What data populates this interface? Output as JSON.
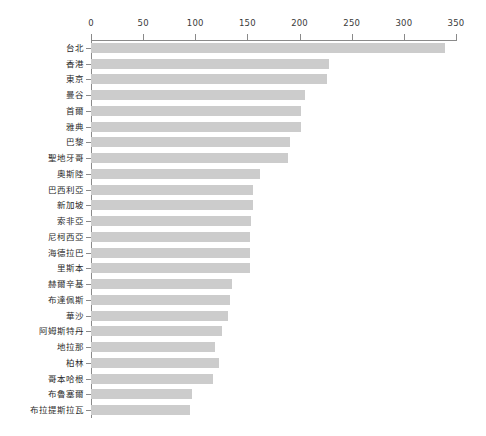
{
  "chart_data": {
    "type": "bar",
    "orientation": "horizontal",
    "title": "",
    "subtitle": "",
    "xlabel": "",
    "ylabel": "",
    "xlim": [
      0,
      350
    ],
    "xticks": [
      0,
      50,
      100,
      150,
      200,
      250,
      300,
      350
    ],
    "grid": false,
    "legend": null,
    "bar_color": "#cccccc",
    "axis_color": "#8a8a8a",
    "text_color": "#2b2b2b",
    "categories": [
      "台北",
      "香港",
      "東京",
      "曼谷",
      "首爾",
      "雅典",
      "巴黎",
      "聖地牙哥",
      "奧斯陸",
      "巴西利亞",
      "新加坡",
      "索非亞",
      "尼柯西亞",
      "海德拉巴",
      "里斯本",
      "赫爾辛基",
      "布達佩斯",
      "華沙",
      "阿姆斯特丹",
      "地拉那",
      "柏林",
      "哥本哈根",
      "布魯塞爾",
      "布拉提斯拉瓦"
    ],
    "values": [
      339,
      228,
      226,
      205,
      201,
      201,
      191,
      189,
      162,
      155,
      155,
      153,
      152,
      152,
      152,
      135,
      133,
      131,
      126,
      119,
      123,
      117,
      97,
      95
    ]
  }
}
